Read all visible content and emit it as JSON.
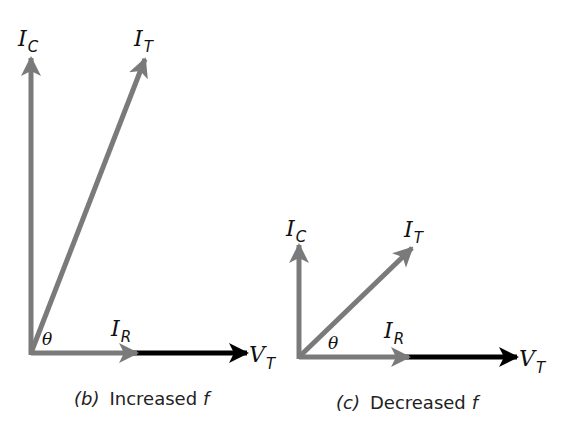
{
  "colors": {
    "current_vector": "#7a7a7a",
    "voltage_vector": "#000000",
    "text": "#111111"
  },
  "diagrams": [
    {
      "id": "b",
      "caption_tag": "(b)",
      "caption_text": "Increased",
      "caption_var": "f",
      "labels": {
        "ic_main": "I",
        "ic_sub": "C",
        "it_main": "I",
        "it_sub": "T",
        "ir_main": "I",
        "ir_sub": "R",
        "vt_main": "V",
        "vt_sub": "T",
        "theta": "θ"
      }
    },
    {
      "id": "c",
      "caption_tag": "(c)",
      "caption_text": "Decreased",
      "caption_var": "f",
      "labels": {
        "ic_main": "I",
        "ic_sub": "C",
        "it_main": "I",
        "it_sub": "T",
        "ir_main": "I",
        "ir_sub": "R",
        "vt_main": "V",
        "vt_sub": "T",
        "theta": "θ"
      }
    }
  ]
}
